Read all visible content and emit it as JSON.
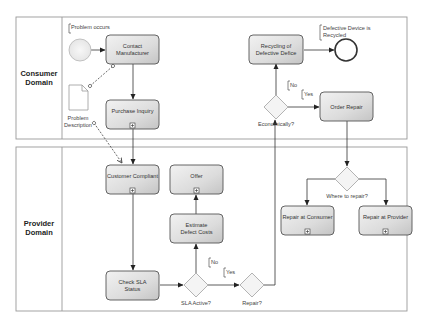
{
  "diagram": {
    "type": "BPMN process diagram",
    "lanes": [
      {
        "id": "consumer",
        "label_line1": "Consumer",
        "label_line2": "Domain"
      },
      {
        "id": "provider",
        "label_line1": "Provider",
        "label_line2": "Domain"
      }
    ],
    "events": {
      "start": {
        "annotation": "Problem occurs"
      },
      "end": {
        "annotation_line1": "Defective Device is",
        "annotation_line2": "Recycled"
      }
    },
    "data_objects": {
      "problem_description": {
        "label_line1": "Problem",
        "label_line2": "Description"
      }
    },
    "tasks": {
      "contact_manufacturer": {
        "line1": "Contact",
        "line2": "Manufacturer"
      },
      "purchase_inquiry": {
        "line1": "Purchase Inquiry"
      },
      "recycling": {
        "line1": "Recycling of",
        "line2": "Defective Defice"
      },
      "order_repair": {
        "line1": "Order Repair"
      },
      "customer_compliant": {
        "line1": "Customer Compliant"
      },
      "offer": {
        "line1": "Offer"
      },
      "estimate_defect_costs": {
        "line1": "Estimate",
        "line2": "Defect Costs"
      },
      "check_sla_status": {
        "line1": "Check SLA",
        "line2": "Status"
      },
      "repair_at_consumer": {
        "line1": "Repair at Consumer"
      },
      "repair_at_provider": {
        "line1": "Repair at Provider"
      }
    },
    "gateways": {
      "economically": {
        "label": "Economically?"
      },
      "where_to_repair": {
        "label": "Where to repair?"
      },
      "sla_active": {
        "label": "SLA Active?"
      },
      "repair": {
        "label": "Repair?"
      }
    },
    "conditions": {
      "econ_no": "No",
      "econ_yes": "Yes",
      "sla_no": "No",
      "sla_yes": "Yes"
    },
    "subprocess_marker": "+"
  }
}
